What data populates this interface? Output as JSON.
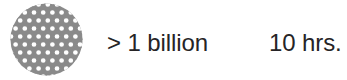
{
  "canvas": {
    "width": 347,
    "height": 80,
    "background": "#ffffff"
  },
  "icon": {
    "name": "circle-packing-cluster-icon",
    "shape": "circle",
    "fill": "#8a8a8a",
    "cell_fill": "#ffffff",
    "cell_stroke": "#8a8a8a",
    "diameter": 73,
    "cell_pitch": 9.2,
    "cell_radius": 3.1,
    "description": "gray disc filled with an offset grid of small white circles"
  },
  "stats": {
    "quantity": {
      "label": "> 1 billion",
      "color": "#262426"
    },
    "duration": {
      "label": "10 hrs.",
      "color": "#262426"
    }
  }
}
